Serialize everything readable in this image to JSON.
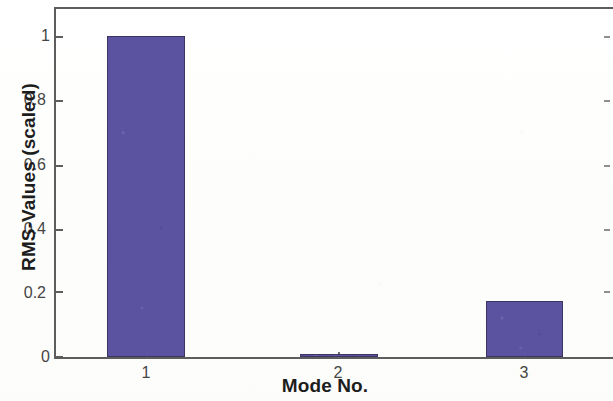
{
  "chart_data": {
    "type": "bar",
    "title": "",
    "xlabel": "Mode No.",
    "ylabel": "RMS-Values (scaled)",
    "categories": [
      "1",
      "2",
      "3"
    ],
    "values": [
      1.0,
      0.007,
      0.175
    ],
    "series": [
      {
        "name": "RMS-Values (scaled)",
        "values": [
          1.0,
          0.007,
          0.175
        ]
      }
    ],
    "ylim": [
      0,
      1.095
    ],
    "xlim": [
      0.5,
      3.5
    ],
    "ytick_labels": [
      "0",
      "0.2",
      "0.4",
      "0.6",
      "0.8",
      "1"
    ],
    "ytick_values": [
      0,
      0.2,
      0.4,
      0.6,
      0.8,
      1
    ],
    "xtick_labels": [
      "1",
      "2",
      "3"
    ],
    "grid": "off",
    "legend": "none",
    "bar_color": "#5b53a0",
    "bar_edge_color": "#3b3560",
    "axis_color": "#5d5d5d",
    "background_color": "#fdfdfc",
    "box": "on"
  }
}
